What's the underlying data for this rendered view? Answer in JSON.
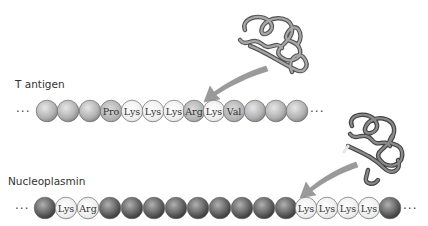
{
  "proteins": [
    {
      "name": "T antigen",
      "label_pos": [
        15,
        78
      ],
      "row_y": 111,
      "leading_ellipsis": "...",
      "trailing_ellipsis": "...",
      "bead_style": "light",
      "beads": [
        {
          "x": 47,
          "label": ""
        },
        {
          "x": 68,
          "label": ""
        },
        {
          "x": 90,
          "label": ""
        },
        {
          "x": 111,
          "label": "Pro",
          "type": "nls-flank"
        },
        {
          "x": 132,
          "label": "Lys",
          "type": "nls"
        },
        {
          "x": 153,
          "label": "Lys",
          "type": "nls"
        },
        {
          "x": 174,
          "label": "Lys",
          "type": "nls"
        },
        {
          "x": 194,
          "label": "Arg",
          "type": "nls-flank"
        },
        {
          "x": 214,
          "label": "Lys",
          "type": "nls"
        },
        {
          "x": 234,
          "label": "Val",
          "type": "nls-flank"
        },
        {
          "x": 255,
          "label": ""
        },
        {
          "x": 276,
          "label": ""
        },
        {
          "x": 297,
          "label": ""
        }
      ]
    },
    {
      "name": "Nucleoplasmin",
      "label_pos": [
        8,
        178
      ],
      "row_y": 208,
      "leading_ellipsis": "...",
      "trailing_ellipsis": "...",
      "bead_style": "dark",
      "beads": [
        {
          "x": 45,
          "label": ""
        },
        {
          "x": 66,
          "label": "Lys",
          "type": "nls"
        },
        {
          "x": 88,
          "label": "Arg",
          "type": "nls"
        },
        {
          "x": 110,
          "label": ""
        },
        {
          "x": 132,
          "label": ""
        },
        {
          "x": 154,
          "label": ""
        },
        {
          "x": 176,
          "label": ""
        },
        {
          "x": 198,
          "label": ""
        },
        {
          "x": 220,
          "label": ""
        },
        {
          "x": 242,
          "label": ""
        },
        {
          "x": 264,
          "label": ""
        },
        {
          "x": 286,
          "label": ""
        },
        {
          "x": 306,
          "label": "Lys",
          "type": "nls"
        },
        {
          "x": 327,
          "label": "Lys",
          "type": "nls"
        },
        {
          "x": 348,
          "label": "Lys",
          "type": "nls"
        },
        {
          "x": 369,
          "label": "Lys",
          "type": "nls"
        },
        {
          "x": 390,
          "label": ""
        }
      ]
    }
  ],
  "colors": {
    "light_bead": "#b8b8b8",
    "dark_bead": "#707070",
    "nls_bead": "#f2f2f2",
    "arrow": "#9a9a9a",
    "ribbon": "#8a8a8a"
  }
}
